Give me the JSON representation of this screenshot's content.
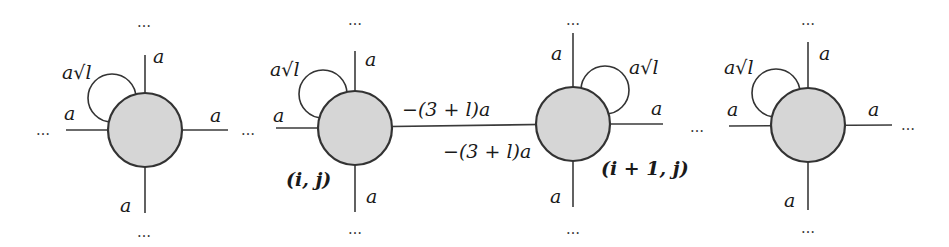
{
  "diagram": {
    "colors": {
      "node_fill": "#d6d6d6",
      "stroke": "#333333",
      "background": "#ffffff"
    },
    "ellipsis": "…",
    "nodes": [
      {
        "id": "node-1",
        "label": "",
        "edge_labels": {
          "top": "a",
          "left": "a",
          "right": "a",
          "bottom": "a"
        },
        "self_loop": {
          "label": "a√l",
          "side": "top-left"
        }
      },
      {
        "id": "node-2",
        "label": "(i, j)",
        "edge_labels": {
          "top": "a",
          "left": "a",
          "right": "−(3 + l)a",
          "bottom": "a"
        },
        "self_loop": {
          "label": "a√l",
          "side": "top-left"
        }
      },
      {
        "id": "node-3",
        "label": "(i + 1, j)",
        "edge_labels": {
          "top": "a",
          "left": "−(3 + l)a",
          "right": "a",
          "bottom": "a"
        },
        "self_loop": {
          "label": "a√l",
          "side": "top-right"
        }
      },
      {
        "id": "node-4",
        "label": "",
        "edge_labels": {
          "top": "a",
          "left": "a",
          "right": "a",
          "bottom": "a"
        },
        "self_loop": {
          "label": "a√l",
          "side": "top-left"
        }
      }
    ]
  }
}
